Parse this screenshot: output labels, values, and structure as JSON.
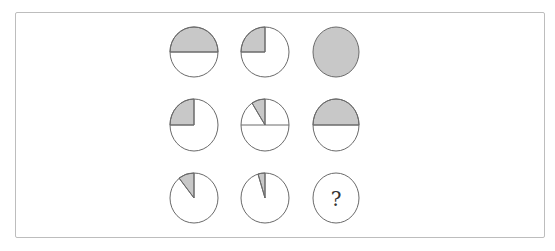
{
  "puzzle": {
    "type": "matrix-reasoning",
    "rows": 3,
    "cols": 3,
    "shade_color": "#c8c8c8",
    "stroke_color": "#6a6a6a",
    "cells": [
      {
        "row": 1,
        "col": 1,
        "shaded_fraction": "1/2",
        "description": "top half shaded, horizontal diameter"
      },
      {
        "row": 1,
        "col": 2,
        "shaded_fraction": "1/4",
        "description": "upper-left quarter shaded"
      },
      {
        "row": 1,
        "col": 3,
        "shaded_fraction": "1",
        "description": "fully shaded"
      },
      {
        "row": 2,
        "col": 1,
        "shaded_fraction": "1/4",
        "description": "upper-left quarter shaded"
      },
      {
        "row": 2,
        "col": 2,
        "shaded_fraction": "1/12",
        "description": "thin wedge shaded, with horizontal diameter and vertical radius"
      },
      {
        "row": 2,
        "col": 3,
        "shaded_fraction": "1/2",
        "description": "top half shaded, horizontal diameter"
      },
      {
        "row": 3,
        "col": 1,
        "shaded_fraction": "1/8",
        "description": "wedge shaded upper-left of vertical"
      },
      {
        "row": 3,
        "col": 2,
        "shaded_fraction": "1/32",
        "description": "very thin wedge shaded"
      },
      {
        "row": 3,
        "col": 3,
        "shaded_fraction": "?",
        "description": "unknown"
      }
    ],
    "question_mark": "?"
  }
}
